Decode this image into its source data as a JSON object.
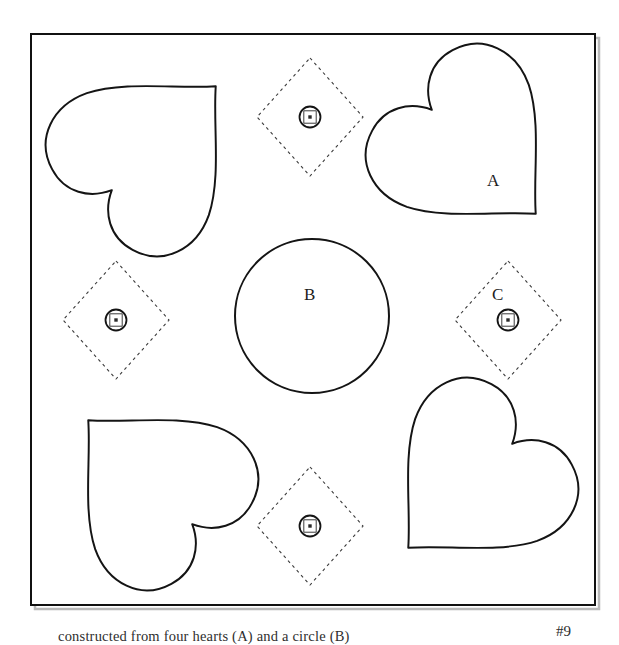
{
  "figure": {
    "number_tag": "#9",
    "caption_partial": "constructed from four hearts (A) and a circle (B)",
    "border": {
      "x": 31,
      "y": 34,
      "width": 564,
      "height": 571,
      "stroke_color": "#111111",
      "stroke_width": 2,
      "shadow_color": "#b9b9b9"
    },
    "labels": [
      {
        "id": "label-a",
        "text": "A",
        "x": 492,
        "y": 181,
        "refers_to": "heart"
      },
      {
        "id": "label-b",
        "text": "B",
        "x": 309,
        "y": 295,
        "refers_to": "center-circle"
      },
      {
        "id": "label-c",
        "text": "C",
        "x": 497,
        "y": 295,
        "refers_to": "dashed-diamond"
      }
    ],
    "center_circle": {
      "cx": 312,
      "cy": 316,
      "r": 77,
      "stroke_color": "#141414",
      "stroke_width": 2,
      "fill": "none"
    },
    "hearts": [
      {
        "id": "heart-top-left",
        "cx": 152,
        "cy": 150,
        "size": 196,
        "rotation_deg": 225
      },
      {
        "id": "heart-top-right",
        "cx": 472,
        "cy": 150,
        "size": 196,
        "rotation_deg": 315
      },
      {
        "id": "heart-bottom-left",
        "cx": 152,
        "cy": 484,
        "size": 196,
        "rotation_deg": 135
      },
      {
        "id": "heart-bottom-right",
        "cx": 472,
        "cy": 484,
        "size": 196,
        "rotation_deg": 45
      }
    ],
    "diamonds": [
      {
        "id": "diamond-top",
        "cx": 310,
        "cy": 117,
        "half_width": 53,
        "half_height": 59
      },
      {
        "id": "diamond-left",
        "cx": 116,
        "cy": 320,
        "half_width": 53,
        "half_height": 59
      },
      {
        "id": "diamond-right",
        "cx": 508,
        "cy": 320,
        "half_width": 53,
        "half_height": 59
      },
      {
        "id": "diamond-bottom",
        "cx": 310,
        "cy": 526,
        "half_width": 53,
        "half_height": 59
      }
    ],
    "diamond_style": {
      "stroke_color": "#3a3a3a",
      "stroke_width": 1.1,
      "dash_pattern": "3 3.5"
    },
    "fastener_symbols": [
      {
        "id": "fastener-top",
        "cx": 310,
        "cy": 117
      },
      {
        "id": "fastener-left",
        "cx": 116,
        "cy": 320
      },
      {
        "id": "fastener-right",
        "cx": 508,
        "cy": 320
      },
      {
        "id": "fastener-bottom",
        "cx": 310,
        "cy": 526
      }
    ],
    "fastener_style": {
      "circle_r": 10.5,
      "square_half": 6.2,
      "dot_half": 1.7,
      "stroke_color": "#141414",
      "inner_stroke_color": "#3d3d3d"
    }
  }
}
